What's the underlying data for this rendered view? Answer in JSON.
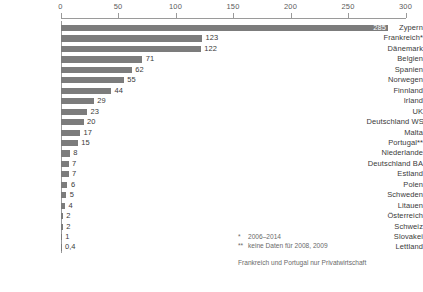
{
  "chart_data": {
    "type": "bar",
    "orientation": "horizontal",
    "title": "",
    "subtitle": "",
    "xlabel": "",
    "ylabel": "",
    "xlim": [
      0,
      300
    ],
    "xticks": [
      0,
      50,
      100,
      150,
      200,
      250,
      300
    ],
    "xtick_labels": [
      "0",
      "50",
      "100",
      "150",
      "200",
      "250",
      "300"
    ],
    "grid": false,
    "legend": false,
    "axis_position": "top",
    "bar_color": "#7c7c7c",
    "categories": [
      "Zypern",
      "Frankreich*",
      "Dänemark",
      "Belgien",
      "Spanien",
      "Norwegen",
      "Finnland",
      "Irland",
      "UK",
      "Deutschland WSI",
      "Malta",
      "Portugal**",
      "Niederlande",
      "Deutschland BA",
      "Estland",
      "Polen",
      "Schweden",
      "Litauen",
      "Österreich",
      "Schweiz",
      "Slovakei",
      "Lettland"
    ],
    "values": [
      285,
      123,
      122,
      71,
      62,
      55,
      44,
      29,
      23,
      20,
      17,
      15,
      8,
      7,
      7,
      6,
      5,
      4,
      2,
      2,
      1,
      0.4
    ],
    "value_labels": [
      "285",
      "123",
      "122",
      "71",
      "62",
      "55",
      "44",
      "29",
      "23",
      "20",
      "17",
      "15",
      "8",
      "7",
      "7",
      "6",
      "5",
      "4",
      "2",
      "2",
      "1",
      "0,4"
    ]
  },
  "notes": {
    "footnote_1_marker": "*",
    "footnote_1_text": "2006–2014",
    "footnote_2_marker": "**",
    "footnote_2_text": "keine Daten für 2008, 2009",
    "footnote_3_text": "Frankreich und Portugal nur Privatwirtschaft"
  }
}
